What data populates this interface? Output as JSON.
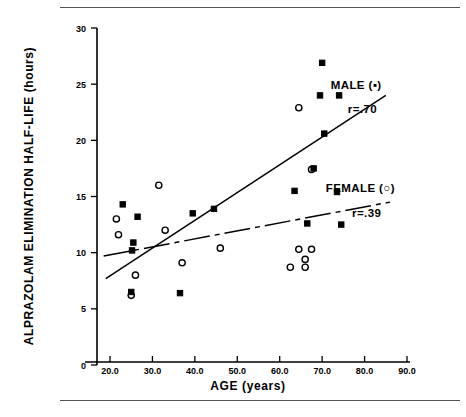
{
  "figure": {
    "title": "",
    "background_color": "#ffffff",
    "ink_color": "#000000",
    "rule_color": "#555555"
  },
  "chart_data": {
    "type": "scatter",
    "title": "",
    "xlabel": "AGE (years)",
    "ylabel": "ALPRAZOLAM ELIMINATION HALF-LIFE (hours)",
    "xlim": [
      17.0,
      90.0
    ],
    "ylim": [
      0,
      30
    ],
    "xticks": [
      20.0,
      30.0,
      40.0,
      50.0,
      60.0,
      70.0,
      80.0,
      90.0
    ],
    "xticklabels": [
      "20.0",
      "30.0",
      "40.0",
      "50.0",
      "60.0",
      "70.0",
      "80.0",
      "90.0"
    ],
    "yticks": [
      0,
      5,
      10,
      15,
      20,
      25,
      30
    ],
    "yticklabels": [
      "0",
      "5",
      "10",
      "15",
      "20",
      "25",
      "30"
    ],
    "grid": false,
    "legend_position": "right",
    "series": [
      {
        "name": "MALE",
        "label": "MALE (▪)",
        "marker": "filled-square",
        "correlation_label": "r=.70",
        "correlation": 0.7,
        "points": [
          {
            "x": 23.0,
            "y": 14.3
          },
          {
            "x": 26.5,
            "y": 13.2
          },
          {
            "x": 25.5,
            "y": 10.9
          },
          {
            "x": 25.2,
            "y": 10.2
          },
          {
            "x": 25.0,
            "y": 6.5
          },
          {
            "x": 36.5,
            "y": 6.4
          },
          {
            "x": 39.5,
            "y": 13.5
          },
          {
            "x": 44.5,
            "y": 13.9
          },
          {
            "x": 63.5,
            "y": 15.5
          },
          {
            "x": 66.5,
            "y": 12.6
          },
          {
            "x": 68.0,
            "y": 17.5
          },
          {
            "x": 70.5,
            "y": 20.6
          },
          {
            "x": 70.0,
            "y": 26.9
          },
          {
            "x": 69.5,
            "y": 24.0
          },
          {
            "x": 74.0,
            "y": 24.0
          },
          {
            "x": 73.5,
            "y": 15.4
          },
          {
            "x": 74.5,
            "y": 12.5
          }
        ]
      },
      {
        "name": "FEMALE",
        "label": "FEMALE (○)",
        "marker": "open-circle",
        "correlation_label": "r=.39",
        "correlation": 0.39,
        "points": [
          {
            "x": 21.5,
            "y": 13.0
          },
          {
            "x": 22.0,
            "y": 11.6
          },
          {
            "x": 25.0,
            "y": 6.2
          },
          {
            "x": 26.0,
            "y": 8.0
          },
          {
            "x": 31.5,
            "y": 16.0
          },
          {
            "x": 33.0,
            "y": 12.0
          },
          {
            "x": 37.0,
            "y": 9.1
          },
          {
            "x": 46.0,
            "y": 10.4
          },
          {
            "x": 64.5,
            "y": 22.9
          },
          {
            "x": 67.5,
            "y": 17.4
          },
          {
            "x": 64.5,
            "y": 10.3
          },
          {
            "x": 67.5,
            "y": 10.3
          },
          {
            "x": 66.0,
            "y": 9.4
          },
          {
            "x": 62.5,
            "y": 8.7
          },
          {
            "x": 66.0,
            "y": 8.7
          }
        ]
      }
    ],
    "fit_lines": [
      {
        "series": "MALE",
        "style": "solid",
        "x_start": 19.0,
        "y_start": 7.7,
        "x_end": 85.0,
        "y_end": 24.0
      },
      {
        "series": "FEMALE",
        "style": "dash-dot",
        "x_start": 18.5,
        "y_start": 9.7,
        "x_end": 86.0,
        "y_end": 14.5
      }
    ],
    "annotations": [
      {
        "text": "MALE (▪)",
        "x": 78.0,
        "y": 24.6
      },
      {
        "text": "r=.70",
        "x": 79.5,
        "y": 22.4
      },
      {
        "text": "FEMALE (○)",
        "x": 79.0,
        "y": 15.4
      },
      {
        "text": "r=.39",
        "x": 80.5,
        "y": 13.2
      }
    ]
  }
}
